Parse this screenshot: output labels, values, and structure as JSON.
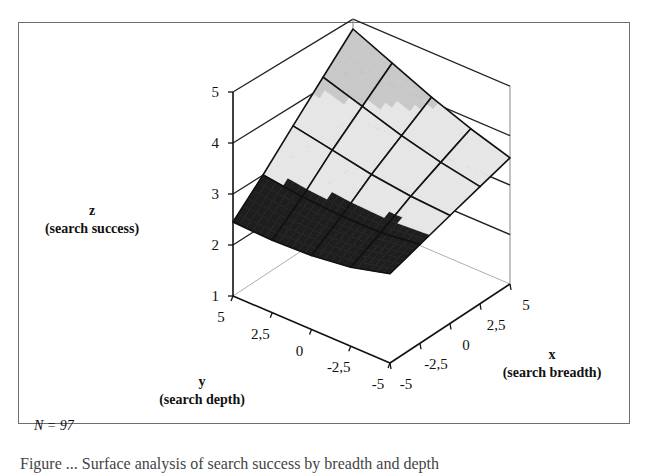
{
  "chart_data": {
    "type": "surface3d",
    "title": "",
    "x_axis": {
      "label": "x",
      "sublabel": "(search breadth)",
      "ticks": [
        "-5",
        "-2,5",
        "0",
        "2,5",
        "5"
      ],
      "range": [
        -5,
        5
      ]
    },
    "y_axis": {
      "label": "y",
      "sublabel": "(search depth)",
      "ticks": [
        "5",
        "2,5",
        "0",
        "-2,5",
        "-5"
      ],
      "range": [
        -5,
        5
      ]
    },
    "z_axis": {
      "label": "z",
      "sublabel": "(search success)",
      "ticks": [
        "1",
        "2",
        "3",
        "4",
        "5"
      ],
      "range": [
        1,
        5
      ]
    },
    "grid_x": [
      -5,
      -2.5,
      0,
      2.5,
      5
    ],
    "grid_y": [
      -5,
      -2.5,
      0,
      2.5,
      5
    ],
    "z_values": [
      [
        2.75,
        2.55,
        2.45,
        2.42,
        2.45
      ],
      [
        2.95,
        2.85,
        2.85,
        2.9,
        3.0
      ],
      [
        3.15,
        3.2,
        3.3,
        3.45,
        3.6
      ],
      [
        3.35,
        3.5,
        3.7,
        3.95,
        4.2
      ],
      [
        3.55,
        3.8,
        4.1,
        4.45,
        4.8
      ]
    ],
    "z_values_note": "rows indexed by x (-5..5), columns by y (-5..5)",
    "band_colors": {
      "2-3": "#1e1e1e",
      "3-4": "#e6e6e6",
      "4-5": "#c8c8c8"
    },
    "annotation": "N = 97"
  },
  "caption": "Figure ... Surface analysis of search success by breadth and depth"
}
